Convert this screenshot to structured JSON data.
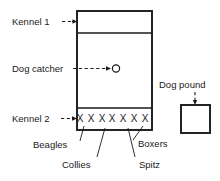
{
  "diagram": {
    "colors": {
      "ink": "#1a1a1a",
      "background": "#ffffff"
    },
    "labels": {
      "kennel_1": "Kennel 1",
      "dog_catcher": "Dog catcher",
      "kennel_2": "Kennel 2",
      "dog_pound": "Dog pound",
      "beagles": "Beagles",
      "collies": "Collies",
      "spitz": "Spitz",
      "boxers": "Boxers"
    },
    "marks": {
      "x_symbol": "X",
      "x_count": 7,
      "dog_catcher_token": "O"
    },
    "shapes": {
      "main_enclosure": {
        "x": 77,
        "y": 11,
        "width": 75,
        "height": 119
      },
      "kennel_1_divider_y": 33,
      "kennel_2_divider_y": 108,
      "dog_pound_box": {
        "x": 181,
        "y": 105,
        "width": 29,
        "height": 28
      }
    }
  }
}
